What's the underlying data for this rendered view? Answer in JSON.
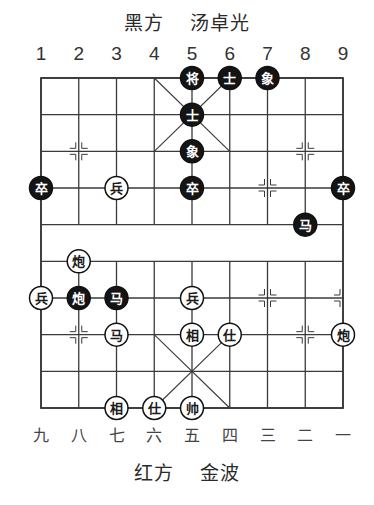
{
  "header": {
    "side": "黑方",
    "player": "汤卓光"
  },
  "footer": {
    "side": "红方",
    "player": "金波"
  },
  "top_file_labels": [
    "1",
    "2",
    "3",
    "4",
    "5",
    "6",
    "7",
    "8",
    "9"
  ],
  "bottom_file_labels": [
    "九",
    "八",
    "七",
    "六",
    "五",
    "四",
    "三",
    "二",
    "一"
  ],
  "colors": {
    "line": "#3a3a3a",
    "black_piece_fill": "#141414",
    "black_piece_text": "#ffffff",
    "red_piece_fill": "#ffffff",
    "red_piece_text": "#1a1a1a"
  },
  "pieces": [
    {
      "side": "black",
      "char": "将",
      "file": 5,
      "rank": 0
    },
    {
      "side": "black",
      "char": "士",
      "file": 6,
      "rank": 0
    },
    {
      "side": "black",
      "char": "象",
      "file": 7,
      "rank": 0
    },
    {
      "side": "black",
      "char": "士",
      "file": 5,
      "rank": 1
    },
    {
      "side": "black",
      "char": "象",
      "file": 5,
      "rank": 2
    },
    {
      "side": "black",
      "char": "卒",
      "file": 1,
      "rank": 3
    },
    {
      "side": "black",
      "char": "卒",
      "file": 5,
      "rank": 3
    },
    {
      "side": "black",
      "char": "卒",
      "file": 9,
      "rank": 3
    },
    {
      "side": "black",
      "char": "马",
      "file": 8,
      "rank": 4
    },
    {
      "side": "black",
      "char": "炮",
      "file": 2,
      "rank": 6
    },
    {
      "side": "black",
      "char": "马",
      "file": 3,
      "rank": 6
    },
    {
      "side": "red",
      "char": "兵",
      "file": 3,
      "rank": 3
    },
    {
      "side": "red",
      "char": "炮",
      "file": 2,
      "rank": 5
    },
    {
      "side": "red",
      "char": "兵",
      "file": 1,
      "rank": 6
    },
    {
      "side": "red",
      "char": "兵",
      "file": 5,
      "rank": 6
    },
    {
      "side": "red",
      "char": "马",
      "file": 3,
      "rank": 7
    },
    {
      "side": "red",
      "char": "相",
      "file": 5,
      "rank": 7
    },
    {
      "side": "red",
      "char": "仕",
      "file": 6,
      "rank": 7
    },
    {
      "side": "red",
      "char": "炮",
      "file": 9,
      "rank": 7
    },
    {
      "side": "red",
      "char": "相",
      "file": 3,
      "rank": 9
    },
    {
      "side": "red",
      "char": "仕",
      "file": 4,
      "rank": 9
    },
    {
      "side": "red",
      "char": "帅",
      "file": 5,
      "rank": 9
    }
  ],
  "markers": [
    {
      "file": 2,
      "rank": 2
    },
    {
      "file": 8,
      "rank": 2
    },
    {
      "file": 7,
      "rank": 3
    },
    {
      "file": 7,
      "rank": 6
    },
    {
      "file": 9,
      "rank": 6
    },
    {
      "file": 2,
      "rank": 7
    },
    {
      "file": 8,
      "rank": 7
    }
  ]
}
